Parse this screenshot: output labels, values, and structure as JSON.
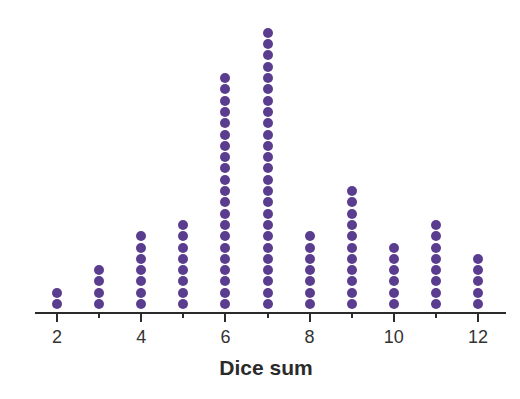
{
  "chart_data": {
    "type": "dot",
    "title": "",
    "xlabel": "Dice sum",
    "ylabel": "",
    "categories": [
      2,
      3,
      4,
      5,
      6,
      7,
      8,
      9,
      10,
      11,
      12
    ],
    "values": [
      2,
      4,
      7,
      8,
      21,
      25,
      7,
      11,
      6,
      8,
      5
    ],
    "tick_labels": [
      "2",
      "4",
      "6",
      "8",
      "10",
      "12"
    ],
    "xlim": [
      2,
      12
    ],
    "grid": false,
    "legend": null,
    "dot_color": "#5b3d8f"
  }
}
